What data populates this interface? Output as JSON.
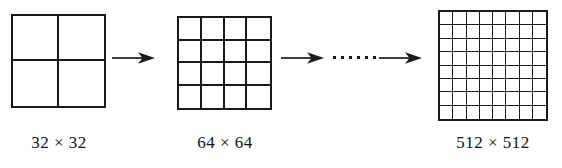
{
  "figure": {
    "background_color": "#ffffff",
    "line_color": "#1a1a1a",
    "text_color": "#111111"
  },
  "stages": [
    {
      "id": "stage-1",
      "caption": "32 × 32",
      "grid_rows": 2,
      "grid_cols": 2,
      "resolution_width": 32,
      "resolution_height": 32
    },
    {
      "id": "stage-2",
      "caption": "64 × 64",
      "grid_rows": 4,
      "grid_cols": 4,
      "resolution_width": 64,
      "resolution_height": 64
    },
    {
      "id": "stage-3",
      "caption": "512 × 512",
      "grid_rows": 8,
      "grid_cols": 8,
      "resolution_width": 512,
      "resolution_height": 512
    }
  ],
  "connectors": [
    {
      "id": "arrow-1",
      "type": "arrow-right",
      "label": ""
    },
    {
      "id": "arrow-2",
      "type": "arrow-right",
      "label": ""
    },
    {
      "id": "ellipsis",
      "type": "dots",
      "dot_count": 6,
      "label": "······"
    },
    {
      "id": "arrow-3",
      "type": "arrow-right",
      "label": ""
    }
  ],
  "chart_data": {
    "type": "diagram",
    "title": "",
    "categories": [
      "32 × 32",
      "64 × 64",
      "512 × 512"
    ],
    "values": [
      2,
      4,
      8
    ]
  }
}
